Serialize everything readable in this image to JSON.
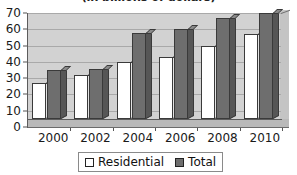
{
  "chart_data": {
    "type": "bar",
    "title": "(in billions of dollars)",
    "xlabel": "",
    "ylabel": "",
    "ylim": [
      0,
      70
    ],
    "ytick_step": 10,
    "yticks": [
      70,
      60,
      50,
      40,
      30,
      20,
      10,
      0
    ],
    "grid": true,
    "legend_position": "bottom",
    "style": "3d-clustered-column",
    "categories": [
      "2000",
      "2002",
      "2004",
      "2006",
      "2008",
      "2010"
    ],
    "series": [
      {
        "name": "Residential",
        "color": "#ffffff",
        "values": [
          22,
          27,
          35,
          38,
          45,
          52
        ]
      },
      {
        "name": "Total",
        "color": "#6e6e6e",
        "values": [
          30,
          31,
          53,
          55,
          62,
          65
        ]
      }
    ]
  },
  "colors": {
    "plot_background": "#d2d2d2",
    "gridline": "#a9a9a9",
    "axis": "#5c5c5c",
    "residential": "#ffffff",
    "total": "#6e6e6e",
    "text": "#1a1a1a"
  }
}
